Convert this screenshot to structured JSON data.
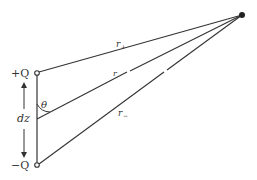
{
  "diagram": {
    "labels": {
      "plus_charge": "+Q",
      "minus_charge": "−Q",
      "separation": "dz",
      "angle": "θ",
      "r_plus": "r",
      "r_plus_sub": "+",
      "r_center": "r",
      "r_minus": "r",
      "r_minus_sub": "−"
    },
    "points": {
      "field_point": [
        242,
        15
      ],
      "plus_charge": [
        37,
        73
      ],
      "minus_charge": [
        37,
        165
      ],
      "midpoint": [
        37,
        119
      ]
    },
    "colors": {
      "line": "#333333",
      "background": "#ffffff"
    }
  }
}
